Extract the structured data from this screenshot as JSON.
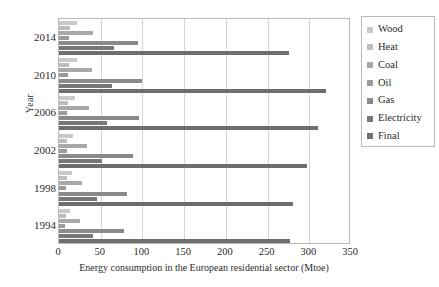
{
  "chart_data": {
    "type": "bar",
    "orientation": "horizontal",
    "title": "",
    "xlabel": "Energy consumption in the European residential sector (Mtoe)",
    "ylabel": "Year",
    "xlim": [
      0,
      350
    ],
    "xticks": [
      0,
      50,
      100,
      150,
      200,
      250,
      300,
      350
    ],
    "grid": true,
    "legend_position": "right",
    "categories": [
      "2014",
      "2010",
      "2006",
      "2002",
      "1998",
      "1994"
    ],
    "series": [
      {
        "name": "Wood",
        "color": "#c9c9c9",
        "values": [
          21,
          22,
          19,
          17,
          15,
          13
        ]
      },
      {
        "name": "Heat",
        "color": "#bdbdbd",
        "values": [
          13,
          12,
          11,
          10,
          9,
          8
        ]
      },
      {
        "name": "Coal",
        "color": "#a8a8a8",
        "values": [
          41,
          40,
          36,
          33,
          27,
          25
        ]
      },
      {
        "name": "Oil",
        "color": "#9a9a9a",
        "values": [
          12,
          11,
          10,
          9,
          8,
          7
        ]
      },
      {
        "name": "Gas",
        "color": "#8a8a8a",
        "values": [
          95,
          99,
          96,
          89,
          82,
          78
        ]
      },
      {
        "name": "Electricity",
        "color": "#777777",
        "values": [
          66,
          63,
          57,
          52,
          45,
          41
        ]
      },
      {
        "name": "Final",
        "color": "#6e6e6e",
        "values": [
          276,
          320,
          311,
          297,
          281,
          277
        ]
      }
    ]
  },
  "axes": {
    "y_title": "Year",
    "x_title": "Energy consumption in the European residential sector (Mtoe)"
  },
  "legend": {
    "entries": [
      {
        "label": "Wood"
      },
      {
        "label": "Heat"
      },
      {
        "label": "Coal"
      },
      {
        "label": "Oil"
      },
      {
        "label": "Gas"
      },
      {
        "label": "Electricity"
      },
      {
        "label": "Final"
      }
    ]
  }
}
